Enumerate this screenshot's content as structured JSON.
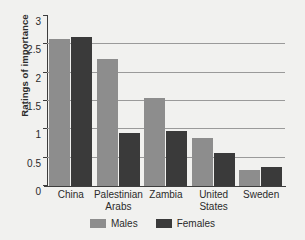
{
  "chart_data": {
    "type": "bar",
    "title": "",
    "xlabel": "",
    "ylabel": "Ratings of importance",
    "ylim": [
      0,
      3
    ],
    "yticks": [
      "0",
      "0.5",
      "1",
      "1.5",
      "2",
      "2.5",
      "3"
    ],
    "ytick_values": [
      0,
      0.5,
      1,
      1.5,
      2,
      2.5,
      3
    ],
    "grid": "horizontal",
    "legend_position": "bottom-center",
    "categories": [
      "China",
      "Palestinian\nArabs",
      "Zambia",
      "United\nStates",
      "Sweden"
    ],
    "series": [
      {
        "name": "Males",
        "color": "#8d8d8d",
        "values": [
          2.6,
          2.25,
          1.55,
          0.85,
          0.29
        ]
      },
      {
        "name": "Females",
        "color": "#3a3a3a",
        "values": [
          2.63,
          0.93,
          0.97,
          0.59,
          0.33
        ]
      }
    ]
  },
  "legend": {
    "items": [
      {
        "label": "Males",
        "color": "#8d8d8d"
      },
      {
        "label": "Females",
        "color": "#3a3a3a"
      }
    ]
  },
  "colors": {
    "background": "#f1f1ef",
    "axis": "#3d3d3d",
    "gridline": "#9a9a9a",
    "text": "#2b2b2b",
    "males": "#8d8d8d",
    "females": "#3a3a3a"
  }
}
